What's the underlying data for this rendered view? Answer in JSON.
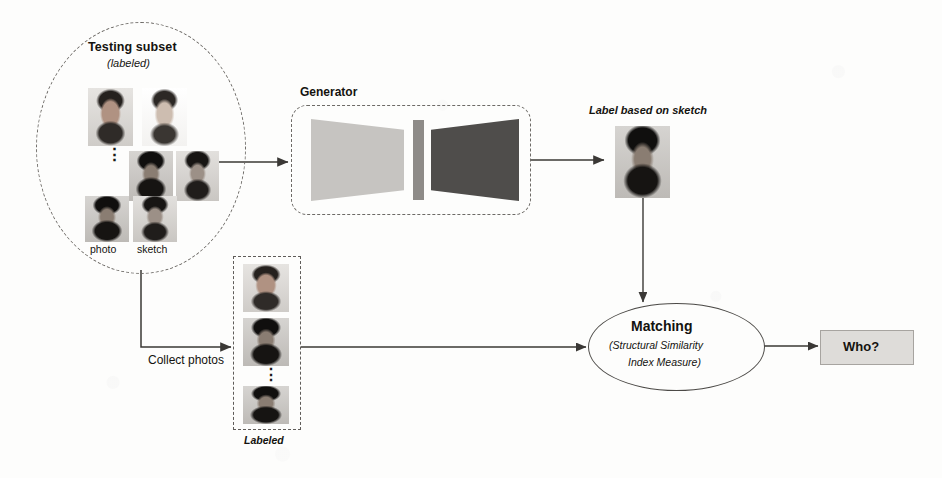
{
  "figure": {
    "type": "pipeline-diagram",
    "background_color": "#fdfdfc",
    "ink_color": "#14130f"
  },
  "testing_subset": {
    "title": "Testing subset",
    "subtitle": "(labeled)",
    "shape": "dashed-ellipse",
    "column_labels": {
      "photo": "photo",
      "sketch": "sketch"
    },
    "ellipsis": "⋮",
    "pairs": [
      {
        "photo_kind": "photo-light",
        "sketch_kind": "sketch-light"
      },
      {
        "photo_kind": "photo-dark",
        "sketch_kind": "sketch-dark"
      },
      {
        "photo_kind": "photo-dark",
        "sketch_kind": "sketch-dark"
      }
    ]
  },
  "generator": {
    "title": "Generator",
    "shape": "dashed-rounded-box",
    "encoder_color": "#c6c4c1",
    "bottleneck_color": "#8e8b88",
    "decoder_color": "#4f4d4b"
  },
  "generated_output": {
    "caption": "Label based on sketch",
    "face_kind": "photo-dark"
  },
  "collect_branch": {
    "arrow_label": "Collect photos",
    "column_caption": "Labeled",
    "ellipsis": "⋮",
    "faces": [
      "photo-light",
      "photo-dark",
      "photo-dark"
    ]
  },
  "matching": {
    "title": "Matching",
    "subtitle_line1": "(Structural Similarity",
    "subtitle_line2": "Index Measure)",
    "shape": "solid-ellipse"
  },
  "result": {
    "label": "Who?",
    "fill_color": "#dedcd9",
    "border_color": "#a7a4a0"
  },
  "connections": [
    {
      "name": "subset-to-generator",
      "from": "testing_subset",
      "to": "generator"
    },
    {
      "name": "generator-to-output",
      "from": "generator",
      "to": "generated_output"
    },
    {
      "name": "output-to-matching",
      "from": "generated_output",
      "to": "matching"
    },
    {
      "name": "subset-to-labeled",
      "from": "testing_subset",
      "to": "collect_branch"
    },
    {
      "name": "labeled-to-matching",
      "from": "collect_branch",
      "to": "matching"
    },
    {
      "name": "matching-to-result",
      "from": "matching",
      "to": "result"
    }
  ]
}
